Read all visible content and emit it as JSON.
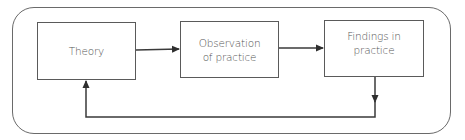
{
  "diagram": {
    "type": "cycle-flowchart",
    "nodes": [
      {
        "id": "theory",
        "label": "Theory"
      },
      {
        "id": "observation",
        "label": "Observation of practice",
        "lines": [
          "Observation",
          "of practice"
        ]
      },
      {
        "id": "findings",
        "label": "Findings in practice",
        "lines": [
          "Findings in",
          "practice"
        ]
      }
    ],
    "edges": [
      {
        "from": "theory",
        "to": "observation"
      },
      {
        "from": "observation",
        "to": "findings"
      },
      {
        "from": "findings",
        "to": "theory",
        "route": "feedback-loop-below"
      }
    ],
    "colors": {
      "line": "#3a3a3a",
      "text": "#555555",
      "frame": "#6a6a6a"
    }
  }
}
